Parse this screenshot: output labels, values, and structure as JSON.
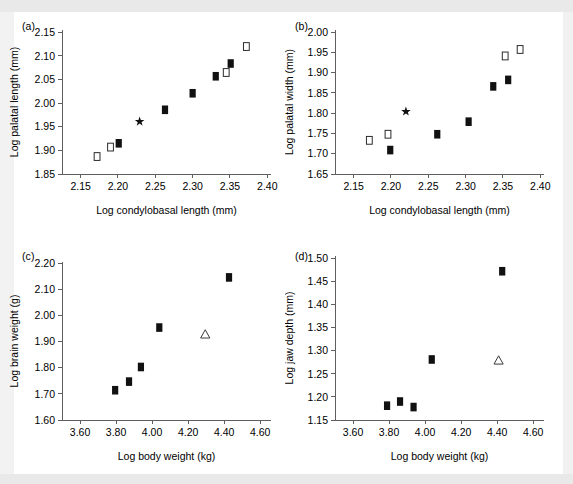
{
  "figure": {
    "background_color": "#ffffff",
    "marker_colors": {
      "filled_square": "#111111",
      "open_square": "#ffffff",
      "open_square_edge": "#2b2b2b",
      "open_triangle": "#ffffff",
      "star": "#111111",
      "axis": "#5f5f5f"
    }
  },
  "panels": [
    {
      "id": "a",
      "label": "(a)"
    },
    {
      "id": "b",
      "label": "(b)"
    },
    {
      "id": "c",
      "label": "(c)"
    },
    {
      "id": "d",
      "label": "(d)"
    }
  ],
  "chart_data": [
    {
      "panel": "a",
      "type": "scatter",
      "title": "(a)",
      "xlabel": "Log condylobasal length (mm)",
      "ylabel": "Log palatal length (mm)",
      "xlim": [
        2.125,
        2.405
      ],
      "ylim": [
        1.85,
        2.155
      ],
      "xticks": [
        2.15,
        2.2,
        2.25,
        2.3,
        2.35,
        2.4
      ],
      "xticklabels": [
        "2.15",
        "2.20",
        "2.25",
        "2.30",
        "2.35",
        "2.40"
      ],
      "yticks": [
        1.85,
        1.9,
        1.95,
        2.0,
        2.05,
        2.1,
        2.15
      ],
      "yticklabels": [
        "1.85",
        "1.90",
        "1.95",
        "2.00",
        "2.05",
        "2.10",
        "2.15"
      ],
      "grid": false,
      "legend": null,
      "series": [
        {
          "name": "filled square",
          "marker": "filled-square",
          "points": [
            {
              "x": 2.201,
              "y": 1.915
            },
            {
              "x": 2.263,
              "y": 1.986
            },
            {
              "x": 2.3,
              "y": 2.021
            },
            {
              "x": 2.331,
              "y": 2.057
            },
            {
              "x": 2.351,
              "y": 2.084
            }
          ]
        },
        {
          "name": "open square",
          "marker": "open-square",
          "points": [
            {
              "x": 2.172,
              "y": 1.887
            },
            {
              "x": 2.19,
              "y": 1.907
            },
            {
              "x": 2.345,
              "y": 2.065
            },
            {
              "x": 2.372,
              "y": 2.12
            }
          ]
        },
        {
          "name": "star",
          "marker": "star",
          "points": [
            {
              "x": 2.229,
              "y": 1.961
            }
          ]
        }
      ]
    },
    {
      "panel": "b",
      "type": "scatter",
      "title": "(b)",
      "xlabel": "Log condylobasal length (mm)",
      "ylabel": "Log palatal width (mm)",
      "xlim": [
        2.125,
        2.405
      ],
      "ylim": [
        1.65,
        2.005
      ],
      "xticks": [
        2.15,
        2.2,
        2.25,
        2.3,
        2.35,
        2.4
      ],
      "xticklabels": [
        "2.15",
        "2.20",
        "2.25",
        "2.30",
        "2.35",
        "2.40"
      ],
      "yticks": [
        1.65,
        1.7,
        1.75,
        1.8,
        1.85,
        1.9,
        1.95,
        2.0
      ],
      "yticklabels": [
        "1.65",
        "1.70",
        "1.75",
        "1.80",
        "1.85",
        "1.90",
        "1.95",
        "2.00"
      ],
      "grid": false,
      "legend": null,
      "series": [
        {
          "name": "filled square",
          "marker": "filled-square",
          "points": [
            {
              "x": 2.199,
              "y": 1.709
            },
            {
              "x": 2.262,
              "y": 1.748
            },
            {
              "x": 2.304,
              "y": 1.779
            },
            {
              "x": 2.337,
              "y": 1.866
            },
            {
              "x": 2.357,
              "y": 1.882
            }
          ]
        },
        {
          "name": "open square",
          "marker": "open-square",
          "points": [
            {
              "x": 2.171,
              "y": 1.733
            },
            {
              "x": 2.196,
              "y": 1.748
            },
            {
              "x": 2.353,
              "y": 1.941
            },
            {
              "x": 2.373,
              "y": 1.957
            }
          ]
        },
        {
          "name": "star",
          "marker": "star",
          "points": [
            {
              "x": 2.22,
              "y": 1.804
            }
          ]
        }
      ]
    },
    {
      "panel": "c",
      "type": "scatter",
      "title": "(c)",
      "xlabel": "Log body weight (kg)",
      "ylabel": "Log brain weight (g)",
      "xlim": [
        3.5,
        4.66
      ],
      "ylim": [
        1.6,
        2.205
      ],
      "xticks": [
        3.6,
        3.8,
        4.0,
        4.2,
        4.4,
        4.6
      ],
      "xticklabels": [
        "3.60",
        "3.80",
        "4.00",
        "4.20",
        "4.40",
        "4.60"
      ],
      "yticks": [
        1.6,
        1.7,
        1.8,
        1.9,
        2.0,
        2.1,
        2.2
      ],
      "yticklabels": [
        "1.60",
        "1.70",
        "1.80",
        "1.90",
        "2.00",
        "2.10",
        "2.20"
      ],
      "grid": false,
      "legend": null,
      "series": [
        {
          "name": "filled square",
          "marker": "filled-square",
          "points": [
            {
              "x": 3.795,
              "y": 1.714
            },
            {
              "x": 3.872,
              "y": 1.747
            },
            {
              "x": 3.938,
              "y": 1.803
            },
            {
              "x": 4.04,
              "y": 1.954
            },
            {
              "x": 4.427,
              "y": 2.146
            }
          ]
        },
        {
          "name": "open triangle",
          "marker": "open-triangle",
          "points": [
            {
              "x": 4.295,
              "y": 1.928
            }
          ]
        }
      ]
    },
    {
      "panel": "d",
      "type": "scatter",
      "title": "(d)",
      "xlabel": "Log body weight (kg)",
      "ylabel": "Log jaw depth (mm)",
      "xlim": [
        3.5,
        4.66
      ],
      "ylim": [
        1.15,
        1.505
      ],
      "xticks": [
        3.6,
        3.8,
        4.0,
        4.2,
        4.4,
        4.6
      ],
      "xticklabels": [
        "3.60",
        "3.80",
        "4.00",
        "4.20",
        "4.40",
        "4.60"
      ],
      "yticks": [
        1.15,
        1.2,
        1.25,
        1.3,
        1.35,
        1.4,
        1.45,
        1.5
      ],
      "yticklabels": [
        "1.15",
        "1.20",
        "1.25",
        "1.30",
        "1.35",
        "1.40",
        "1.45",
        "1.50"
      ],
      "grid": false,
      "legend": null,
      "series": [
        {
          "name": "filled square",
          "marker": "filled-square",
          "points": [
            {
              "x": 3.789,
              "y": 1.181
            },
            {
              "x": 3.861,
              "y": 1.19
            },
            {
              "x": 3.936,
              "y": 1.178
            },
            {
              "x": 4.037,
              "y": 1.281
            },
            {
              "x": 4.428,
              "y": 1.472
            }
          ]
        },
        {
          "name": "open triangle",
          "marker": "open-triangle",
          "points": [
            {
              "x": 4.408,
              "y": 1.279
            }
          ]
        }
      ]
    }
  ]
}
